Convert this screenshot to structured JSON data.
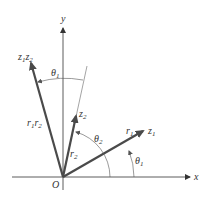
{
  "figure": {
    "axes": {
      "x_label": "x",
      "y_label": "y",
      "origin_label": "O"
    },
    "vectors": [
      {
        "name": "z1",
        "label": "z",
        "sub": "1",
        "modulus_label": "r",
        "modulus_sub": "1",
        "angle_label": "θ",
        "angle_sub": "1"
      },
      {
        "name": "z2",
        "label": "z",
        "sub": "2",
        "modulus_label": "r",
        "modulus_sub": "2",
        "angle_label": "θ",
        "angle_sub": "2"
      },
      {
        "name": "z1z2",
        "label": "z",
        "sub": "1",
        "label2": "z",
        "sub2": "2",
        "modulus_label": "r",
        "modulus_sub": "1",
        "modulus_label2": "r",
        "modulus_sub2": "2",
        "angle_label": "θ",
        "angle_sub": "1"
      }
    ],
    "colors": {
      "vector": "#4a4a4a",
      "axis": "#333333",
      "arc": "#555555"
    }
  }
}
